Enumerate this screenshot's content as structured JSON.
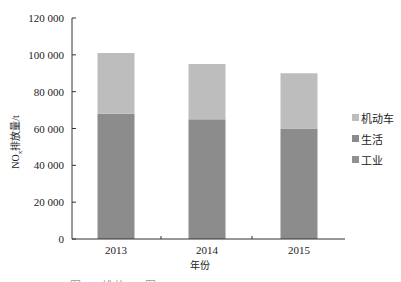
{
  "chart_data": {
    "type": "bar",
    "stacked": true,
    "title": "",
    "xlabel": "年份",
    "ylabel": "NOx排放量/t",
    "ylim": [
      0,
      120000
    ],
    "yticks": [
      0,
      20000,
      40000,
      60000,
      80000,
      100000,
      120000
    ],
    "ytick_labels": [
      "0",
      "20 000",
      "40 000",
      "60 000",
      "80 000",
      "100 000",
      "120 000"
    ],
    "categories": [
      "2013",
      "2014",
      "2015"
    ],
    "series": [
      {
        "name": "工业+生活（图中两段颜色相近，未能区分）",
        "values": [
          68000,
          65000,
          60000
        ],
        "color": "#8c8c8c"
      },
      {
        "name": "机动车",
        "values": [
          33000,
          30000,
          30000
        ],
        "color": "#bdbdbd"
      }
    ],
    "totals": [
      101000,
      95000,
      90000
    ],
    "legend": {
      "position": "right",
      "entries": [
        {
          "label": "机动车",
          "color": "#bdbdbd"
        },
        {
          "label": "生活",
          "color": "#8a8a8a"
        },
        {
          "label": "工业",
          "color": "#909090"
        }
      ]
    },
    "grid": false
  },
  "axis": {
    "y_title_main": "NO",
    "y_title_sub": "x",
    "y_title_rest": "排放量/t",
    "x_title": "年份"
  },
  "caption": "图 … 排放 … 图"
}
